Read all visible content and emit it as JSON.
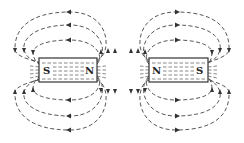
{
  "diagram": {
    "colors": {
      "line": "#444444",
      "background": "#ffffff"
    },
    "magnets": [
      {
        "id": "left",
        "left_pole": "S",
        "right_pole": "N"
      },
      {
        "id": "right",
        "left_pole": "N",
        "right_pole": "S"
      }
    ]
  }
}
